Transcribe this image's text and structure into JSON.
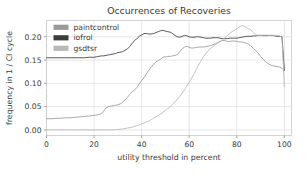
{
  "chart_data": {
    "type": "line",
    "title": "Occurrences of Recoveries",
    "xlabel": "utility threshold in percent",
    "ylabel": "frequency in 1 / CI cycle",
    "xlim": [
      0,
      103
    ],
    "ylim": [
      -0.012,
      0.235
    ],
    "grid": true,
    "legend_position": "upper left",
    "xticks": [
      0,
      20,
      40,
      60,
      80,
      100
    ],
    "xticklabels": [
      "0",
      "20",
      "40",
      "60",
      "80",
      "100"
    ],
    "yticks": [
      0.0,
      0.05,
      0.1,
      0.15,
      0.2
    ],
    "yticklabels": [
      "0.00",
      "0.05",
      "0.10",
      "0.15",
      "0.20"
    ],
    "series": [
      {
        "name": "paintcontrol",
        "color": "#9a9a9a",
        "x": [
          0,
          2,
          4,
          6,
          8,
          10,
          12,
          14,
          16,
          18,
          20,
          22,
          23,
          24,
          25,
          26,
          27,
          28,
          29,
          30,
          31,
          32,
          33,
          34,
          35,
          36,
          37,
          38,
          39,
          40,
          41,
          42,
          43,
          44,
          45,
          46,
          47,
          48,
          49,
          50,
          51,
          52,
          53,
          54,
          55,
          56,
          57,
          58,
          59,
          60,
          61,
          62,
          63,
          64,
          65,
          66,
          67,
          68,
          69,
          70,
          71,
          72,
          73,
          74,
          75,
          76,
          77,
          78,
          79,
          80,
          81,
          82,
          83,
          84,
          85,
          86,
          87,
          88,
          89,
          90,
          91,
          92,
          93,
          94,
          95,
          96,
          97,
          98,
          99,
          100
        ],
        "y": [
          0.024,
          0.024,
          0.025,
          0.025,
          0.026,
          0.026,
          0.027,
          0.028,
          0.029,
          0.03,
          0.031,
          0.033,
          0.035,
          0.04,
          0.047,
          0.05,
          0.051,
          0.052,
          0.053,
          0.054,
          0.056,
          0.059,
          0.064,
          0.07,
          0.076,
          0.082,
          0.086,
          0.091,
          0.099,
          0.106,
          0.112,
          0.12,
          0.128,
          0.135,
          0.141,
          0.146,
          0.149,
          0.152,
          0.156,
          0.157,
          0.158,
          0.158,
          0.159,
          0.16,
          0.162,
          0.168,
          0.174,
          0.178,
          0.18,
          0.177,
          0.176,
          0.176,
          0.177,
          0.178,
          0.178,
          0.178,
          0.179,
          0.18,
          0.181,
          0.183,
          0.185,
          0.188,
          0.19,
          0.192,
          0.192,
          0.19,
          0.19,
          0.191,
          0.191,
          0.19,
          0.189,
          0.189,
          0.188,
          0.186,
          0.184,
          0.18,
          0.175,
          0.17,
          0.165,
          0.158,
          0.152,
          0.147,
          0.143,
          0.14,
          0.138,
          0.137,
          0.136,
          0.135,
          0.132,
          0.128
        ]
      },
      {
        "name": "iofrol",
        "color": "#3c3c3c",
        "x": [
          0,
          2,
          4,
          6,
          8,
          10,
          12,
          14,
          16,
          18,
          20,
          21,
          22,
          23,
          24,
          25,
          26,
          27,
          28,
          29,
          30,
          31,
          32,
          33,
          34,
          35,
          36,
          37,
          38,
          39,
          40,
          41,
          42,
          43,
          44,
          45,
          46,
          47,
          48,
          49,
          50,
          51,
          52,
          53,
          54,
          55,
          56,
          57,
          58,
          59,
          60,
          61,
          62,
          63,
          64,
          65,
          66,
          67,
          68,
          69,
          70,
          71,
          72,
          73,
          74,
          75,
          76,
          77,
          78,
          79,
          80,
          81,
          82,
          83,
          84,
          85,
          86,
          87,
          88,
          89,
          90,
          91,
          92,
          93,
          94,
          95,
          96,
          97,
          98,
          99,
          100
        ],
        "y": [
          0.155,
          0.155,
          0.155,
          0.155,
          0.155,
          0.155,
          0.155,
          0.155,
          0.155,
          0.156,
          0.156,
          0.157,
          0.158,
          0.159,
          0.159,
          0.16,
          0.161,
          0.162,
          0.163,
          0.164,
          0.166,
          0.167,
          0.168,
          0.171,
          0.174,
          0.179,
          0.186,
          0.192,
          0.196,
          0.201,
          0.204,
          0.207,
          0.207,
          0.206,
          0.206,
          0.207,
          0.209,
          0.211,
          0.213,
          0.214,
          0.212,
          0.211,
          0.21,
          0.207,
          0.203,
          0.2,
          0.199,
          0.201,
          0.203,
          0.202,
          0.2,
          0.199,
          0.199,
          0.2,
          0.2,
          0.199,
          0.198,
          0.197,
          0.197,
          0.197,
          0.198,
          0.198,
          0.198,
          0.197,
          0.196,
          0.196,
          0.196,
          0.197,
          0.197,
          0.197,
          0.197,
          0.198,
          0.199,
          0.2,
          0.201,
          0.201,
          0.201,
          0.202,
          0.202,
          0.203,
          0.203,
          0.203,
          0.203,
          0.203,
          0.203,
          0.203,
          0.202,
          0.201,
          0.201,
          0.2,
          0.128
        ]
      },
      {
        "name": "gsdtsr",
        "color": "#b8b8b8",
        "x": [
          0,
          5,
          10,
          15,
          20,
          22,
          24,
          26,
          28,
          29,
          30,
          31,
          32,
          33,
          34,
          35,
          36,
          37,
          38,
          39,
          40,
          41,
          42,
          43,
          44,
          45,
          46,
          47,
          48,
          49,
          50,
          51,
          52,
          53,
          54,
          55,
          56,
          57,
          58,
          59,
          60,
          61,
          62,
          63,
          64,
          65,
          66,
          67,
          68,
          69,
          70,
          71,
          72,
          73,
          74,
          75,
          76,
          77,
          78,
          79,
          80,
          81,
          82,
          83,
          84,
          85,
          86,
          87,
          88,
          89,
          90,
          91,
          92,
          93,
          94,
          95,
          96,
          97,
          98,
          99,
          100
        ],
        "y": [
          0.0,
          0.0,
          0.0,
          0.0,
          0.0,
          0.0,
          0.0,
          0.0,
          0.0,
          0.0005,
          0.001,
          0.0015,
          0.002,
          0.003,
          0.004,
          0.005,
          0.006,
          0.0075,
          0.009,
          0.011,
          0.013,
          0.015,
          0.017,
          0.019,
          0.022,
          0.025,
          0.028,
          0.031,
          0.034,
          0.038,
          0.042,
          0.046,
          0.05,
          0.055,
          0.06,
          0.066,
          0.072,
          0.079,
          0.086,
          0.094,
          0.102,
          0.111,
          0.12,
          0.13,
          0.14,
          0.149,
          0.157,
          0.164,
          0.17,
          0.175,
          0.179,
          0.183,
          0.186,
          0.19,
          0.194,
          0.198,
          0.203,
          0.207,
          0.211,
          0.214,
          0.217,
          0.221,
          0.224,
          0.223,
          0.22,
          0.217,
          0.215,
          0.209,
          0.204,
          0.203,
          0.203,
          0.202,
          0.202,
          0.202,
          0.203,
          0.203,
          0.203,
          0.203,
          0.202,
          0.199,
          0.093
        ]
      }
    ]
  },
  "legend": {
    "entries": [
      {
        "label": "paintcontrol",
        "color": "#9a9a9a"
      },
      {
        "label": "iofrol",
        "color": "#3c3c3c"
      },
      {
        "label": "gsdtsr",
        "color": "#b8b8b8"
      }
    ]
  }
}
